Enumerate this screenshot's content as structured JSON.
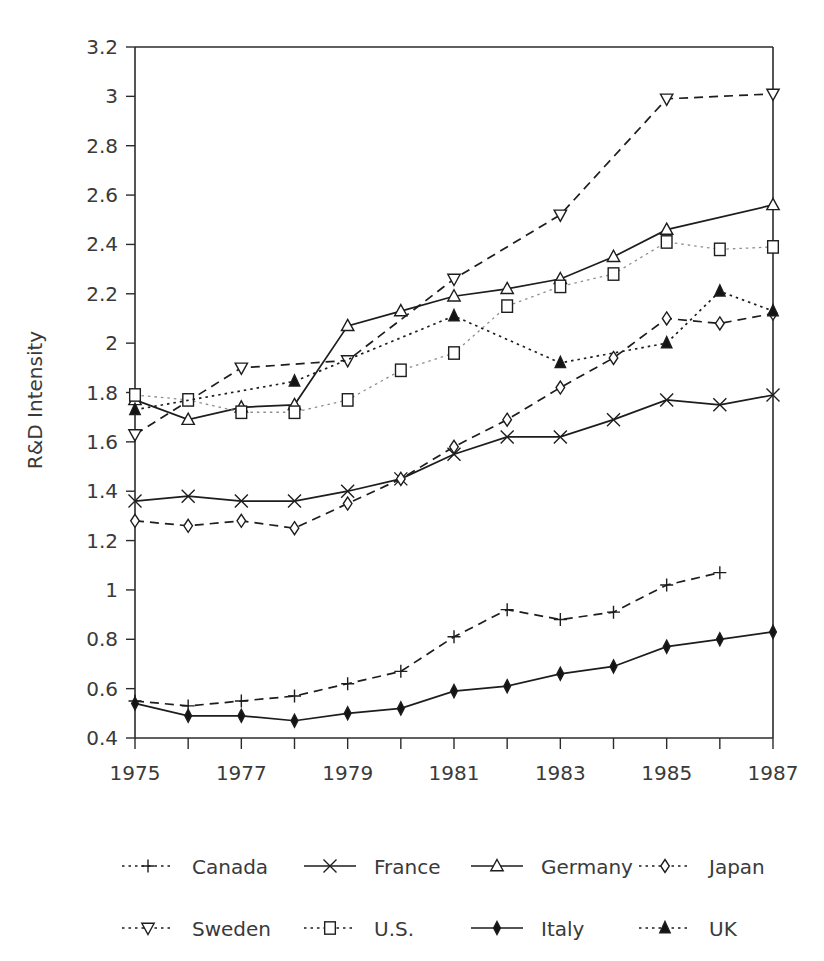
{
  "chart_data": {
    "type": "line",
    "title": "",
    "xlabel": "",
    "ylabel": "R&D Intensity",
    "xlim": [
      1975,
      1987
    ],
    "ylim": [
      0.4,
      3.2
    ],
    "ytick_step": 0.2,
    "grid": false,
    "legend_position": "bottom",
    "x": [
      1975,
      1976,
      1977,
      1978,
      1979,
      1980,
      1981,
      1982,
      1983,
      1984,
      1985,
      1986,
      1987
    ],
    "xtick_labels": [
      "1975",
      "1977",
      "1979",
      "1981",
      "1983",
      "1985",
      "1987"
    ],
    "xtick_values": [
      1975,
      1977,
      1979,
      1981,
      1983,
      1985,
      1987
    ],
    "ytick_labels": [
      "0.4",
      "0.6",
      "0.8",
      "1",
      "1.2",
      "1.4",
      "1.6",
      "1.8",
      "2",
      "2.2",
      "2.4",
      "2.6",
      "2.8",
      "3",
      "3.2"
    ],
    "ytick_values": [
      0.4,
      0.6,
      0.8,
      1.0,
      1.2,
      1.4,
      1.6,
      1.8,
      2.0,
      2.2,
      2.4,
      2.6,
      2.8,
      3.0,
      3.2
    ],
    "series": [
      {
        "name": "Canada",
        "marker": "plus",
        "line": "dashed",
        "fill": "none",
        "x": [
          1975,
          1976,
          1977,
          1978,
          1979,
          1980,
          1981,
          1982,
          1983,
          1984,
          1985,
          1986
        ],
        "values": [
          0.55,
          0.53,
          0.55,
          0.57,
          0.62,
          0.67,
          0.81,
          0.92,
          0.88,
          0.91,
          1.02,
          1.07
        ]
      },
      {
        "name": "France",
        "marker": "cross",
        "line": "solid",
        "fill": "none",
        "x": [
          1975,
          1976,
          1977,
          1978,
          1979,
          1980,
          1981,
          1982,
          1983,
          1984,
          1985,
          1986,
          1987
        ],
        "values": [
          1.36,
          1.38,
          1.36,
          1.36,
          1.4,
          1.45,
          1.55,
          1.62,
          1.62,
          1.69,
          1.77,
          1.75,
          1.79
        ]
      },
      {
        "name": "Germany",
        "marker": "triangle-up",
        "line": "solid",
        "fill": "open",
        "x": [
          1975,
          1976,
          1977,
          1978,
          1979,
          1980,
          1981,
          1982,
          1983,
          1984,
          1985,
          1987
        ],
        "values": [
          1.77,
          1.69,
          1.74,
          1.75,
          2.07,
          2.13,
          2.19,
          2.22,
          2.26,
          2.35,
          2.46,
          2.56
        ]
      },
      {
        "name": "Japan",
        "marker": "diamond-open",
        "line": "dashed",
        "fill": "open",
        "x": [
          1975,
          1976,
          1977,
          1978,
          1979,
          1980,
          1981,
          1982,
          1983,
          1984,
          1985,
          1986,
          1987
        ],
        "values": [
          1.28,
          1.26,
          1.28,
          1.25,
          1.35,
          1.45,
          1.58,
          1.69,
          1.82,
          1.94,
          2.1,
          2.08,
          2.12
        ]
      },
      {
        "name": "Sweden",
        "marker": "triangle-down",
        "line": "dashed",
        "fill": "open",
        "x": [
          1975,
          1977,
          1979,
          1981,
          1983,
          1985,
          1987
        ],
        "values": [
          1.63,
          1.9,
          1.93,
          2.26,
          2.52,
          2.99,
          3.01
        ]
      },
      {
        "name": "U.S.",
        "marker": "square",
        "line": "dotted",
        "fill": "open",
        "x": [
          1975,
          1976,
          1977,
          1978,
          1979,
          1980,
          1981,
          1982,
          1983,
          1984,
          1985,
          1986,
          1987
        ],
        "values": [
          1.79,
          1.77,
          1.72,
          1.72,
          1.77,
          1.89,
          1.96,
          2.15,
          2.23,
          2.28,
          2.41,
          2.38,
          2.39
        ]
      },
      {
        "name": "Italy",
        "marker": "diamond-filled",
        "line": "solid",
        "fill": "filled",
        "x": [
          1975,
          1976,
          1977,
          1978,
          1979,
          1980,
          1981,
          1982,
          1983,
          1984,
          1985,
          1986,
          1987
        ],
        "values": [
          0.54,
          0.49,
          0.49,
          0.47,
          0.5,
          0.52,
          0.59,
          0.61,
          0.66,
          0.69,
          0.77,
          0.8,
          0.83
        ]
      },
      {
        "name": "UK",
        "marker": "triangle-up-filled",
        "line": "dotted",
        "fill": "filled",
        "x": [
          1975,
          1978,
          1981,
          1983,
          1985,
          1986,
          1987
        ],
        "values": [
          1.73,
          1.845,
          2.11,
          1.92,
          2.0,
          2.21,
          2.13
        ]
      }
    ]
  },
  "legend": {
    "rows": [
      [
        {
          "label": "Canada",
          "marker": "plus",
          "line": "dotted"
        },
        {
          "label": "France",
          "marker": "cross",
          "line": "solid"
        },
        {
          "label": "Germany",
          "marker": "triangle-up",
          "line": "solid"
        },
        {
          "label": "Japan",
          "marker": "diamond-open",
          "line": "dotted"
        }
      ],
      [
        {
          "label": "Sweden",
          "marker": "triangle-down",
          "line": "dotted"
        },
        {
          "label": "U.S.",
          "marker": "square",
          "line": "dotted"
        },
        {
          "label": "Italy",
          "marker": "diamond-filled",
          "line": "solid"
        },
        {
          "label": "UK",
          "marker": "triangle-up-filled",
          "line": "dotted"
        }
      ]
    ]
  },
  "colors": {
    "ink": "#1d1d1d",
    "text": "#3a3a3a",
    "light_line": "#8d8d8d",
    "background": "#ffffff"
  }
}
